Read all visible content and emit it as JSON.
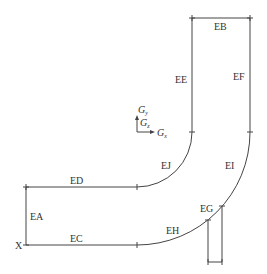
{
  "diagram": {
    "type": "pipe-bend-segment-diagram",
    "segments": [
      {
        "id": "EA",
        "label": "EA"
      },
      {
        "id": "EB",
        "label": "EB"
      },
      {
        "id": "EC",
        "label": "EC"
      },
      {
        "id": "ED",
        "label": "ED"
      },
      {
        "id": "EE",
        "label": "EE"
      },
      {
        "id": "EF",
        "label": "EF"
      },
      {
        "id": "EG",
        "label": "EG"
      },
      {
        "id": "EH",
        "label": "EH"
      },
      {
        "id": "EI",
        "label": "EI"
      },
      {
        "id": "EJ",
        "label": "EJ"
      }
    ],
    "origin_label": "X",
    "axes": {
      "y_label": "G",
      "y_sub": "y",
      "z_label": "G",
      "z_sub": "z",
      "x_label": "G",
      "x_sub": "x"
    }
  }
}
